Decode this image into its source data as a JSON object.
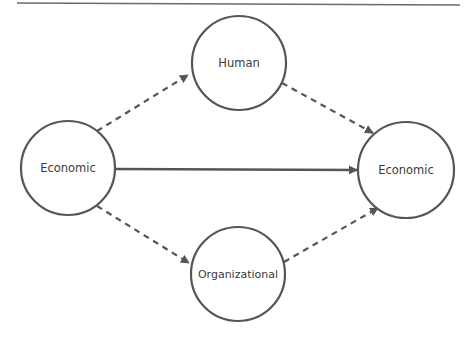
{
  "diagram": {
    "type": "flow",
    "colors": {
      "stroke": "#555555",
      "text": "#3a3a3a",
      "background": "#ffffff",
      "rule": "#666666"
    },
    "nodes": [
      {
        "id": "economic-source",
        "label": "Economic",
        "cx": 68,
        "cy": 168,
        "r": 47
      },
      {
        "id": "human",
        "label": "Human",
        "cx": 239,
        "cy": 63,
        "r": 47
      },
      {
        "id": "organizational",
        "label": "Organizational",
        "cx": 238,
        "cy": 274,
        "r": 47
      },
      {
        "id": "economic-target",
        "label": "Economic",
        "cx": 406,
        "cy": 170,
        "r": 48
      }
    ],
    "edges": [
      {
        "from": "economic-source",
        "to": "human",
        "style": "dashed"
      },
      {
        "from": "human",
        "to": "economic-target",
        "style": "dashed"
      },
      {
        "from": "economic-source",
        "to": "organizational",
        "style": "dashed"
      },
      {
        "from": "organizational",
        "to": "economic-target",
        "style": "dashed"
      },
      {
        "from": "economic-source",
        "to": "economic-target",
        "style": "solid"
      }
    ]
  }
}
